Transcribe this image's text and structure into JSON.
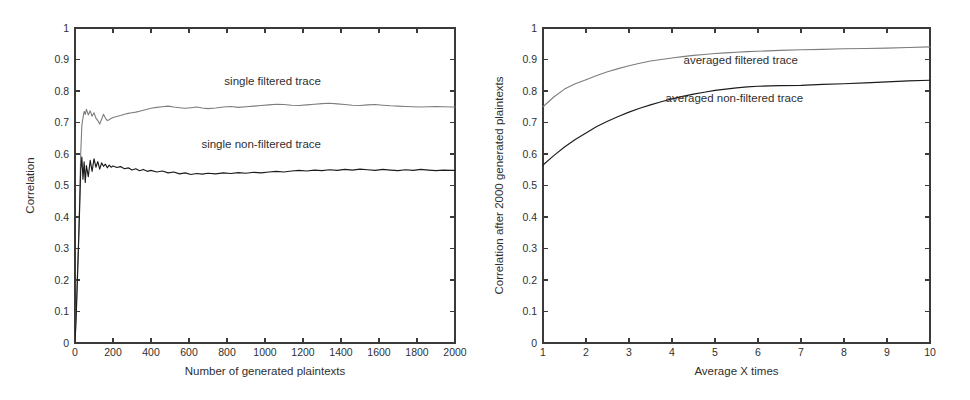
{
  "figure": {
    "background": "#ffffff",
    "width": 970,
    "height": 400
  },
  "colors": {
    "axis": "#3a3a3a",
    "text": "#2f2f2f",
    "series_non_filtered": "#1c1c1c",
    "series_filtered": "#7d7d7d"
  },
  "chart_data": [
    {
      "type": "line",
      "panel": "left",
      "title": "",
      "xlabel": "Number of generated plaintexts",
      "ylabel": "Correlation",
      "xlim": [
        0,
        2000
      ],
      "ylim": [
        0,
        1
      ],
      "xticks": [
        0,
        200,
        400,
        600,
        800,
        1000,
        1200,
        1400,
        1600,
        1800,
        2000
      ],
      "xticklabels": [
        "0",
        "200",
        "400",
        "600",
        "800",
        "1000",
        "1200",
        "1400",
        "1600",
        "1800",
        "2000"
      ],
      "yticks": [
        0,
        0.1,
        0.2,
        0.3,
        0.4,
        0.5,
        0.6,
        0.7,
        0.8,
        0.9,
        1
      ],
      "yticklabels": [
        "0",
        "0.1",
        "0.2",
        "0.3",
        "0.4",
        "0.5",
        "0.6",
        "0.7",
        "0.8",
        "0.9",
        "1"
      ],
      "grid": false,
      "legend_position": "inline-annotation",
      "annotations": [
        {
          "text": "single filtered trace",
          "x": 1040,
          "y": 0.82
        },
        {
          "text": "single non-filtered trace",
          "x": 980,
          "y": 0.62
        }
      ],
      "series": [
        {
          "name": "single filtered trace",
          "color": "#7d7d7d",
          "x": [
            0,
            6,
            12,
            18,
            24,
            30,
            36,
            42,
            48,
            54,
            60,
            70,
            80,
            90,
            100,
            110,
            120,
            130,
            140,
            150,
            160,
            170,
            180,
            190,
            200,
            220,
            240,
            260,
            280,
            300,
            320,
            340,
            360,
            380,
            400,
            430,
            460,
            490,
            520,
            550,
            580,
            610,
            640,
            670,
            700,
            740,
            780,
            820,
            860,
            900,
            940,
            980,
            1020,
            1060,
            1100,
            1140,
            1180,
            1220,
            1260,
            1300,
            1340,
            1380,
            1420,
            1460,
            1500,
            1540,
            1580,
            1620,
            1660,
            1700,
            1740,
            1780,
            1820,
            1860,
            1900,
            1940,
            1980,
            2000
          ],
          "y": [
            0.0,
            0.09,
            0.2,
            0.31,
            0.44,
            0.6,
            0.69,
            0.715,
            0.735,
            0.726,
            0.742,
            0.724,
            0.737,
            0.72,
            0.731,
            0.714,
            0.706,
            0.695,
            0.71,
            0.726,
            0.714,
            0.706,
            0.709,
            0.713,
            0.716,
            0.719,
            0.722,
            0.726,
            0.729,
            0.731,
            0.733,
            0.736,
            0.739,
            0.742,
            0.745,
            0.748,
            0.75,
            0.752,
            0.749,
            0.747,
            0.745,
            0.747,
            0.749,
            0.746,
            0.744,
            0.746,
            0.749,
            0.751,
            0.748,
            0.75,
            0.752,
            0.754,
            0.756,
            0.758,
            0.757,
            0.755,
            0.754,
            0.756,
            0.758,
            0.76,
            0.761,
            0.759,
            0.757,
            0.755,
            0.754,
            0.756,
            0.757,
            0.755,
            0.753,
            0.752,
            0.751,
            0.75,
            0.749,
            0.75,
            0.751,
            0.75,
            0.749,
            0.749
          ]
        },
        {
          "name": "single non-filtered trace",
          "color": "#1c1c1c",
          "x": [
            0,
            6,
            12,
            18,
            24,
            30,
            36,
            42,
            48,
            54,
            60,
            70,
            80,
            90,
            100,
            110,
            120,
            130,
            140,
            150,
            160,
            170,
            180,
            190,
            200,
            220,
            240,
            260,
            280,
            300,
            320,
            340,
            360,
            380,
            400,
            430,
            460,
            490,
            520,
            550,
            580,
            610,
            640,
            670,
            700,
            740,
            780,
            820,
            860,
            900,
            940,
            980,
            1020,
            1060,
            1100,
            1140,
            1180,
            1220,
            1260,
            1300,
            1340,
            1380,
            1420,
            1460,
            1500,
            1540,
            1580,
            1620,
            1660,
            1700,
            1740,
            1780,
            1820,
            1860,
            1900,
            1940,
            1980,
            2000
          ],
          "y": [
            0.0,
            0.08,
            0.19,
            0.3,
            0.42,
            0.55,
            0.59,
            0.52,
            0.575,
            0.51,
            0.563,
            0.528,
            0.58,
            0.545,
            0.585,
            0.558,
            0.576,
            0.552,
            0.572,
            0.561,
            0.568,
            0.556,
            0.565,
            0.558,
            0.562,
            0.557,
            0.56,
            0.553,
            0.556,
            0.549,
            0.553,
            0.547,
            0.551,
            0.545,
            0.548,
            0.543,
            0.546,
            0.54,
            0.543,
            0.537,
            0.54,
            0.535,
            0.538,
            0.536,
            0.539,
            0.537,
            0.54,
            0.538,
            0.541,
            0.539,
            0.542,
            0.54,
            0.543,
            0.545,
            0.543,
            0.546,
            0.548,
            0.546,
            0.549,
            0.547,
            0.55,
            0.548,
            0.551,
            0.549,
            0.552,
            0.55,
            0.548,
            0.551,
            0.549,
            0.547,
            0.55,
            0.548,
            0.551,
            0.549,
            0.547,
            0.549,
            0.548,
            0.548
          ]
        }
      ]
    },
    {
      "type": "line",
      "panel": "right",
      "title": "",
      "xlabel": "Average X times",
      "ylabel": "Correlation after 2000 generated plaintexts",
      "xlim": [
        1,
        10
      ],
      "ylim": [
        0,
        1
      ],
      "xticks": [
        1,
        2,
        3,
        4,
        5,
        6,
        7,
        8,
        9,
        10
      ],
      "xticklabels": [
        "1",
        "2",
        "3",
        "4",
        "5",
        "6",
        "7",
        "8",
        "9",
        "10"
      ],
      "yticks": [
        0,
        0.1,
        0.2,
        0.3,
        0.4,
        0.5,
        0.6,
        0.7,
        0.8,
        0.9,
        1
      ],
      "yticklabels": [
        "0",
        "0.1",
        "0.2",
        "0.3",
        "0.4",
        "0.5",
        "0.6",
        "0.7",
        "0.8",
        "0.9",
        "1"
      ],
      "grid": false,
      "legend_position": "inline-annotation",
      "annotations": [
        {
          "text": "averaged filtered trace",
          "x": 5.6,
          "y": 0.885
        },
        {
          "text": "averaged non-filtered trace",
          "x": 5.45,
          "y": 0.765
        }
      ],
      "series": [
        {
          "name": "averaged filtered trace",
          "color": "#7d7d7d",
          "x": [
            1,
            1.25,
            1.5,
            1.75,
            2,
            2.25,
            2.5,
            2.75,
            3,
            3.25,
            3.5,
            3.75,
            4,
            4.25,
            4.5,
            4.75,
            5,
            5.25,
            5.5,
            5.75,
            6,
            6.5,
            7,
            7.5,
            8,
            8.5,
            9,
            9.5,
            10
          ],
          "y": [
            0.75,
            0.781,
            0.806,
            0.823,
            0.836,
            0.849,
            0.861,
            0.871,
            0.88,
            0.888,
            0.895,
            0.9,
            0.905,
            0.909,
            0.913,
            0.916,
            0.919,
            0.921,
            0.923,
            0.925,
            0.926,
            0.929,
            0.931,
            0.932,
            0.934,
            0.935,
            0.936,
            0.938,
            0.94
          ]
        },
        {
          "name": "averaged non-filtered trace",
          "color": "#1c1c1c",
          "x": [
            1,
            1.25,
            1.5,
            1.75,
            2,
            2.25,
            2.5,
            2.75,
            3,
            3.25,
            3.5,
            3.75,
            4,
            4.25,
            4.5,
            4.75,
            5,
            5.25,
            5.5,
            5.75,
            6,
            6.5,
            7,
            7.5,
            8,
            8.5,
            9,
            9.5,
            10
          ],
          "y": [
            0.565,
            0.595,
            0.622,
            0.646,
            0.667,
            0.687,
            0.704,
            0.719,
            0.733,
            0.745,
            0.756,
            0.766,
            0.775,
            0.783,
            0.79,
            0.796,
            0.802,
            0.806,
            0.81,
            0.813,
            0.815,
            0.817,
            0.818,
            0.821,
            0.823,
            0.826,
            0.829,
            0.832,
            0.834
          ]
        }
      ]
    }
  ]
}
